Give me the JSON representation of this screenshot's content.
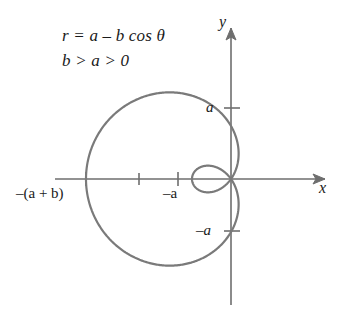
{
  "figure": {
    "kind": "polar-curve-diagram",
    "equation_line_1": "r = a – b cos θ",
    "equation_line_2": "b > a > 0",
    "axes": {
      "y_label": "y",
      "x_label": "x"
    },
    "tick_labels": {
      "y_positive": "a",
      "y_negative": "–a",
      "x_neg_a": "–a",
      "x_neg_a_plus_b": "–(a + b)"
    },
    "colors": {
      "curve": "#7a7a7a",
      "axis": "#6e6e6e",
      "text": "#1a1a1a",
      "background": "#ffffff"
    }
  },
  "chart_data": {
    "type": "line",
    "title": "r = a – b cos θ",
    "subtitle": "b > a > 0",
    "curve_name": "limaçon with inner loop",
    "polar_equation": "r = a - b*cos(theta)",
    "parameters": {
      "a": 53,
      "b": 92,
      "condition": "b > a > 0"
    },
    "xlabel": "x",
    "ylabel": "y",
    "xlim": [
      -158,
      120
    ],
    "ylim": [
      -118,
      118
    ],
    "grid": false,
    "legend": null,
    "origin_px": [
      231,
      179
    ],
    "px_per_unit": 1,
    "x_ticks": [
      {
        "value": -145,
        "label": "–(a + b)",
        "px": 86
      },
      {
        "value": -92,
        "label": "",
        "px": 139
      },
      {
        "value": -53,
        "label": "–a",
        "px": 178
      }
    ],
    "y_ticks": [
      {
        "value": 71,
        "label": "a",
        "px": 108
      },
      {
        "value": -71,
        "label": "–a",
        "px": 231
      }
    ],
    "key_points": [
      {
        "name": "outer-max-left",
        "theta_deg": 0,
        "r": -145,
        "xy": [
          -145,
          0
        ]
      },
      {
        "name": "top-extent",
        "xy": [
          -45,
          106
        ]
      },
      {
        "name": "bottom-extent",
        "xy": [
          -45,
          -106
        ]
      },
      {
        "name": "inner-loop-tip",
        "xy": [
          -39,
          0
        ]
      },
      {
        "name": "pole",
        "xy": [
          0,
          0
        ]
      }
    ],
    "annotations": [
      {
        "text": "r = a – b cos θ",
        "x_px": 62,
        "y_px": 27
      },
      {
        "text": "b > a > 0",
        "x_px": 62,
        "y_px": 52
      }
    ]
  }
}
